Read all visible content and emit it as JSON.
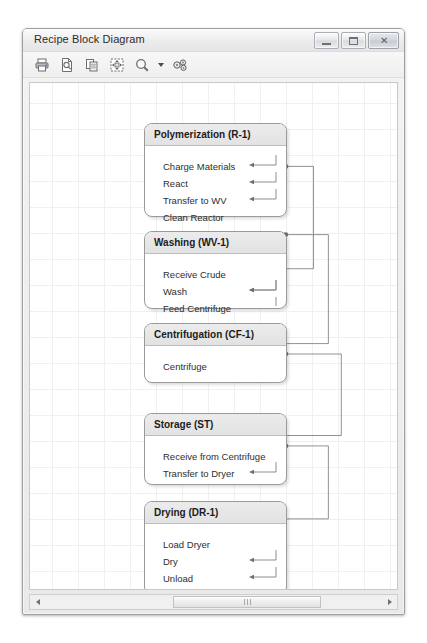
{
  "window": {
    "title": "Recipe Block Diagram",
    "controls": [
      {
        "name": "minimize-button",
        "glyph": "minimize"
      },
      {
        "name": "maximize-button",
        "glyph": "maximize"
      },
      {
        "name": "close-button",
        "glyph": "✕"
      }
    ]
  },
  "toolbar": {
    "items": [
      {
        "name": "print-icon",
        "label": "Print"
      },
      {
        "name": "print-preview-icon",
        "label": "Print Preview"
      },
      {
        "name": "copy-icon",
        "label": "Copy"
      },
      {
        "name": "fit-to-window-icon",
        "label": "Fit to Window"
      },
      {
        "name": "zoom-icon",
        "label": "Zoom"
      },
      {
        "name": "zoom-dropdown-caret-icon",
        "label": "Zoom Options"
      },
      {
        "name": "settings-icon",
        "label": "Settings"
      }
    ]
  },
  "diagram": {
    "blocks": [
      {
        "id": "polymerization",
        "title": "Polymerization (R-1)",
        "steps": [
          "Charge Materials",
          "React",
          "Transfer to WV",
          "Clean Reactor"
        ]
      },
      {
        "id": "washing",
        "title": "Washing (WV-1)",
        "steps": [
          "Receive Crude",
          "Wash",
          "Feed Centrifuge"
        ]
      },
      {
        "id": "centrifugation",
        "title": "Centrifugation (CF-1)",
        "steps": [
          "Centrifuge"
        ]
      },
      {
        "id": "storage",
        "title": "Storage (ST)",
        "steps": [
          "Receive from Centrifuge",
          "Transfer to Dryer"
        ]
      },
      {
        "id": "drying",
        "title": "Drying (DR-1)",
        "steps": [
          "Load Dryer",
          "Dry",
          "Unload"
        ]
      }
    ],
    "colors": {
      "block_border": "#9a9a9a",
      "block_header": "#e6e6e6",
      "connector": "#8a8a8a",
      "grid": "#f0f0f0",
      "canvas": "#ffffff"
    }
  },
  "scrollbar": {
    "left_arrow": "◄",
    "right_arrow": "►",
    "grip": "|||"
  }
}
